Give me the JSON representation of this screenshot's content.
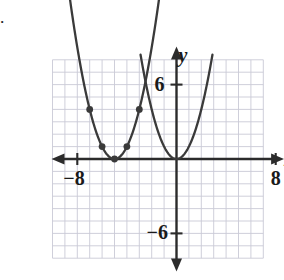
{
  "figure": {
    "corner_mark": "·",
    "axis_labels": {
      "x": "x",
      "y": "y"
    },
    "tick_labels": {
      "x_negative": "−8",
      "x_positive": "8",
      "y_positive": "6",
      "y_negative": "−6"
    }
  },
  "chart_data": {
    "type": "line",
    "title": "",
    "xlabel": "x",
    "ylabel": "y",
    "xlim": [
      -10,
      8.6
    ],
    "ylim": [
      -9,
      9
    ],
    "grid": true,
    "grid_step": 1,
    "grid_xrange": [
      -10,
      7
    ],
    "grid_yrange": [
      -8,
      8
    ],
    "legend": "none",
    "x_ticks": [
      -8,
      8
    ],
    "y_ticks": [
      6,
      -6
    ],
    "axis_color": "#2b2b2b",
    "grid_color": "#c9c9d6",
    "curve_color": "#3a3a3a",
    "point_color": "#3a3a3a",
    "series": [
      {
        "name": "shifted-parabola",
        "equation": "y = (x + 5)^2",
        "vertex": [
          -5,
          0
        ],
        "a": 1,
        "x_start": -9.2,
        "x_end": -1.0,
        "marked_points": [
          [
            -7,
            4
          ],
          [
            -6,
            1
          ],
          [
            -5,
            0
          ],
          [
            -4,
            1
          ],
          [
            -3,
            4
          ]
        ]
      },
      {
        "name": "base-parabola",
        "equation": "y = x^2",
        "vertex": [
          0,
          0
        ],
        "a": 1,
        "x_start": -2.9,
        "x_end": 2.9,
        "marked_points": []
      }
    ],
    "annotations": [
      {
        "text": "curves intersect",
        "at": [
          -2.5,
          6.25
        ]
      }
    ]
  }
}
